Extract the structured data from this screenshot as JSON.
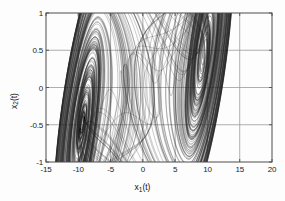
{
  "chart_data": {
    "type": "line",
    "title": "",
    "subtitle": "",
    "xlabel": "x_1(t)",
    "ylabel": "x_2(t)",
    "xlabel_base": "x",
    "xlabel_sub": "1",
    "xlabel_tail": "(t)",
    "ylabel_base": "x",
    "ylabel_sub": "2",
    "ylabel_tail": "(t)",
    "xlim": [
      -15,
      20
    ],
    "ylim": [
      -1,
      1
    ],
    "xticks": [
      -15,
      -10,
      -5,
      0,
      5,
      10,
      15,
      20
    ],
    "xtick_labels": [
      "-15",
      "-10",
      "-5",
      "0",
      "5",
      "10",
      "15",
      "20"
    ],
    "yticks": [
      -1,
      -0.5,
      0,
      0.5,
      1
    ],
    "ytick_labels": [
      "-1",
      "-0.5",
      "0",
      "0.5",
      "1"
    ],
    "grid": true,
    "legend": null,
    "line_color": "#2b2b2b",
    "grid_color": "#9a9a9a",
    "axis_color": "#4d4d4d",
    "background_color": "#fdfdfd",
    "series": [
      {
        "name": "trajectory",
        "comment": "Double-scroll attractor: two spiral foci connected by heteroclinic-like sweeps",
        "focus_a": [
          -5.2,
          -0.27
        ],
        "focus_b": [
          5.4,
          0.28
        ],
        "outer_extent_x": [
          -13.8,
          15.4
        ],
        "outer_extent_y": [
          -0.86,
          0.95
        ],
        "tilt_slope": 0.062,
        "turns": 150
      }
    ]
  }
}
